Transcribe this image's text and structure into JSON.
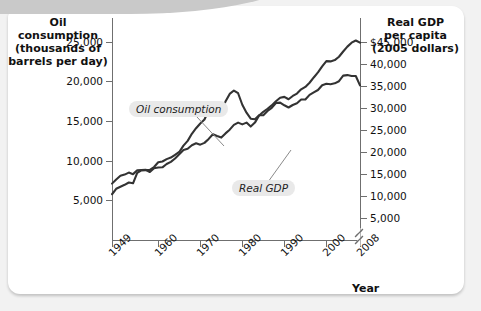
{
  "figure": {
    "left_axis_title": [
      "Oil consumption",
      "(thousands of",
      "barrels per day)"
    ],
    "right_axis_title": [
      "Real GDP",
      "per capita",
      "(2005 dollars)"
    ],
    "x_axis_title": "Year",
    "callouts": [
      {
        "name": "oil-consumption-callout",
        "text": "Oil consumption"
      },
      {
        "name": "real-gdp-callout",
        "text": "Real GDP"
      }
    ]
  },
  "chart_data": {
    "type": "line",
    "title": "",
    "xlabel": "Year",
    "ylabel": "Oil consumption (thousands of barrels per day)",
    "y2label": "Real GDP per capita (2005 dollars)",
    "grid": false,
    "legend": "inline-callouts",
    "xlim": [
      1949,
      2008
    ],
    "xticks": [
      1949,
      1960,
      1970,
      1980,
      1990,
      2000,
      2008
    ],
    "xticklabels": [
      "1949",
      "1960",
      "1970",
      "1980",
      "1990",
      "2000",
      "2008"
    ],
    "ylim": [
      0,
      28000
    ],
    "yticks": [
      5000,
      10000,
      15000,
      20000,
      25000
    ],
    "yticklabels": [
      "5,000",
      "10,000",
      "15,000",
      "20,000",
      "25,000"
    ],
    "y2lim": [
      0,
      50400
    ],
    "y2ticks": [
      5000,
      10000,
      15000,
      20000,
      25000,
      30000,
      35000,
      40000,
      45000
    ],
    "y2ticklabels": [
      "5,000",
      "10,000",
      "15,000",
      "20,000",
      "25,000",
      "30,000",
      "35,000",
      "40,000",
      "$45,000"
    ],
    "axis_break_marker": true,
    "series": [
      {
        "name": "Oil consumption",
        "axis": "left",
        "units": "thousands of barrels per day",
        "color": "#333333",
        "x": [
          1949,
          1950,
          1951,
          1952,
          1953,
          1954,
          1955,
          1956,
          1957,
          1958,
          1959,
          1960,
          1961,
          1962,
          1963,
          1964,
          1965,
          1966,
          1967,
          1968,
          1969,
          1970,
          1971,
          1972,
          1973,
          1974,
          1975,
          1976,
          1977,
          1978,
          1979,
          1980,
          1981,
          1982,
          1983,
          1984,
          1985,
          1986,
          1987,
          1988,
          1989,
          1990,
          1991,
          1992,
          1993,
          1994,
          1995,
          1996,
          1997,
          1998,
          1999,
          2000,
          2001,
          2002,
          2003,
          2004,
          2005,
          2006,
          2007,
          2008
        ],
        "y": [
          5770,
          6460,
          6720,
          6960,
          7250,
          7150,
          8460,
          8780,
          8800,
          8850,
          9200,
          9800,
          9900,
          10200,
          10400,
          10750,
          11100,
          11900,
          12500,
          13400,
          14100,
          14700,
          15200,
          16370,
          17300,
          16650,
          16320,
          17460,
          18430,
          18850,
          18510,
          17060,
          16060,
          15300,
          15230,
          15730,
          15730,
          16280,
          16670,
          17280,
          17330,
          16990,
          16710,
          17030,
          17240,
          17720,
          17720,
          18310,
          18620,
          18920,
          19520,
          19700,
          19650,
          19760,
          20030,
          20730,
          20800,
          20690,
          20680,
          19500
        ]
      },
      {
        "name": "Real GDP",
        "axis": "right",
        "units": "2005 dollars per capita",
        "color": "#333333",
        "x": [
          1949,
          1950,
          1951,
          1952,
          1953,
          1954,
          1955,
          1956,
          1957,
          1958,
          1959,
          1960,
          1961,
          1962,
          1963,
          1964,
          1965,
          1966,
          1967,
          1968,
          1969,
          1970,
          1971,
          1972,
          1973,
          1974,
          1975,
          1976,
          1977,
          1978,
          1979,
          1980,
          1981,
          1982,
          1983,
          1984,
          1985,
          1986,
          1987,
          1988,
          1989,
          1990,
          1991,
          1992,
          1993,
          1994,
          1995,
          1996,
          1997,
          1998,
          1999,
          2000,
          2001,
          2002,
          2003,
          2004,
          2005,
          2006,
          2007,
          2008
        ],
        "y": [
          12800,
          13750,
          14580,
          14850,
          15300,
          14950,
          15800,
          15900,
          15950,
          15450,
          16300,
          16450,
          16500,
          17250,
          17750,
          18500,
          19450,
          20450,
          20700,
          21500,
          21950,
          21650,
          22050,
          22950,
          24000,
          23600,
          23250,
          24200,
          25050,
          26150,
          26650,
          26250,
          26650,
          25750,
          26650,
          28250,
          29100,
          29800,
          30550,
          31500,
          32300,
          32500,
          31950,
          32700,
          33250,
          34200,
          34750,
          35700,
          36900,
          38050,
          39400,
          40600,
          40550,
          40850,
          41600,
          42800,
          43900,
          44800,
          45300,
          44800
        ]
      }
    ]
  }
}
